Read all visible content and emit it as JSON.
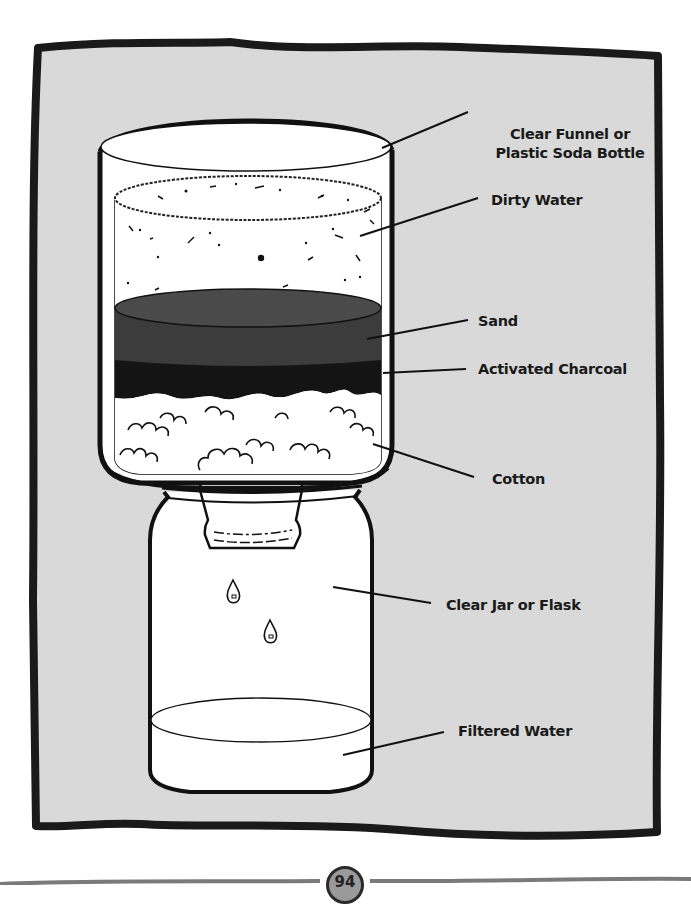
{
  "diagram": {
    "background_color": "#d9d9d9",
    "frame_color": "#1a1a1a",
    "sand_color": "#3c3c3c",
    "charcoal_color": "#141414",
    "labels": {
      "funnel": [
        "Clear Funnel or",
        "Plastic Soda Bottle"
      ],
      "dirty_water": "Dirty Water",
      "sand": "Sand",
      "charcoal": "Activated Charcoal",
      "cotton": "Cotton",
      "jar": "Clear Jar or Flask",
      "filtered_water": "Filtered Water"
    },
    "components_top_to_bottom": [
      "Clear Funnel or Plastic Soda Bottle",
      "Dirty Water",
      "Sand",
      "Activated Charcoal",
      "Cotton",
      "Clear Jar or Flask",
      "Filtered Water"
    ]
  },
  "footer": {
    "page_number": "94"
  }
}
